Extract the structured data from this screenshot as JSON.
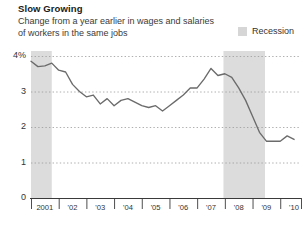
{
  "title": "Slow Growing",
  "subtitle_line1": "Change from a year earlier in wages and salaries",
  "subtitle_line2": "of workers in the same jobs",
  "legend": {
    "recession_label": "Recession",
    "swatch_name": "recession-swatch",
    "swatch_color": "#d6d6d6"
  },
  "colors": {
    "line": "#6b6b6b",
    "recession_band": "#dcdcdc",
    "gridline": "#9a9a9a",
    "axis": "#3a3a3a",
    "text": "#333333",
    "background": "#ffffff"
  },
  "chart_data": {
    "type": "line",
    "title": "Slow Growing",
    "subtitle": "Change from a year earlier in wages and salaries of workers in the same jobs",
    "xlabel": "",
    "ylabel": "",
    "ylim": [
      0,
      4
    ],
    "yticks": [
      0,
      1,
      2,
      3,
      4
    ],
    "ytick_labels": [
      "0",
      "1",
      "2",
      "3",
      "4%"
    ],
    "xlim": [
      2001.0,
      2010.75
    ],
    "xticks": [
      2001,
      2002,
      2003,
      2004,
      2005,
      2006,
      2007,
      2008,
      2009,
      2010
    ],
    "xtick_labels": [
      "2001",
      "'02",
      "'03",
      "'04",
      "'05",
      "'06",
      "'07",
      "'08",
      "'09",
      "'10"
    ],
    "grid": true,
    "grid_axis": "y",
    "grid_style": "dashed",
    "legend_position": "top-right",
    "series": [
      {
        "name": "Employment cost index, wages and salaries",
        "x": [
          2001.0,
          2001.25,
          2001.5,
          2001.75,
          2002.0,
          2002.25,
          2002.5,
          2002.75,
          2003.0,
          2003.25,
          2003.5,
          2003.75,
          2004.0,
          2004.25,
          2004.5,
          2004.75,
          2005.0,
          2005.25,
          2005.5,
          2005.75,
          2006.0,
          2006.25,
          2006.5,
          2006.75,
          2007.0,
          2007.25,
          2007.5,
          2007.75,
          2008.0,
          2008.25,
          2008.5,
          2008.75,
          2009.0,
          2009.25,
          2009.5,
          2009.75,
          2010.0,
          2010.25,
          2010.5
        ],
        "values": [
          3.85,
          3.7,
          3.72,
          3.8,
          3.6,
          3.55,
          3.2,
          3.0,
          2.85,
          2.9,
          2.65,
          2.8,
          2.6,
          2.75,
          2.8,
          2.7,
          2.6,
          2.55,
          2.6,
          2.45,
          2.6,
          2.75,
          2.9,
          3.1,
          3.1,
          3.35,
          3.65,
          3.45,
          3.5,
          3.4,
          3.1,
          2.75,
          2.3,
          1.85,
          1.6,
          1.6,
          1.6,
          1.75,
          1.65
        ]
      }
    ],
    "recession_bands": [
      {
        "start": 2001.0,
        "end": 2001.75,
        "label": "Recession"
      },
      {
        "start": 2007.95,
        "end": 2009.45,
        "label": "Recession"
      }
    ]
  }
}
